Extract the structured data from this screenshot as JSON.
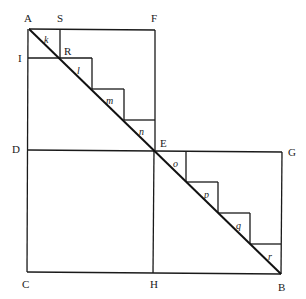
{
  "diagram": {
    "title": "",
    "points": {
      "A": "A",
      "S": "S",
      "F": "F",
      "I": "I",
      "R": "R",
      "D": "D",
      "E": "E",
      "G": "G",
      "C": "C",
      "H": "H",
      "B": "B"
    },
    "upper_triangles": [
      "k",
      "l",
      "m",
      "n"
    ],
    "lower_triangles": [
      "o",
      "p",
      "q",
      "r"
    ]
  }
}
